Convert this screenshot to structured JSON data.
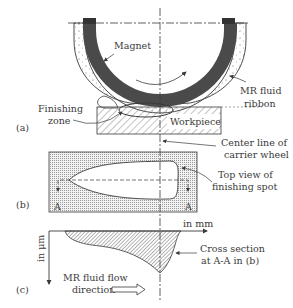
{
  "figure": {
    "panels": {
      "a": {
        "tag": "(a)",
        "labels": {
          "magnet": "Magnet",
          "mr_fluid_line1": "MR fluid",
          "mr_fluid_line2": "ribbon",
          "finishing_line1": "Finishing",
          "finishing_line2": "zone",
          "workpiece": "Workpiece",
          "centerline_line1": "Center line of",
          "centerline_line2": "carrier wheel"
        }
      },
      "b": {
        "tag": "(b)",
        "labels": {
          "section_left": "A",
          "section_right": "A",
          "topview_line1": "Top view of",
          "topview_line2": "finishing spot"
        }
      },
      "c": {
        "tag": "(c)",
        "labels": {
          "x_unit": "in mm",
          "y_unit": "in μm",
          "cross_line1": "Cross section",
          "cross_line2": "at A-A in (b)",
          "flow_line1": "MR fluid flow",
          "flow_line2": "direction"
        }
      }
    },
    "colors": {
      "magnet": "#4a4a4a",
      "line": "#3a3a3a",
      "stipple_bg": "#e4e4e4"
    }
  }
}
